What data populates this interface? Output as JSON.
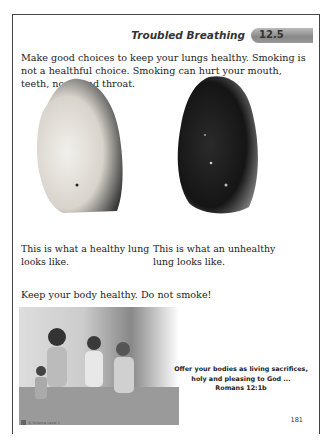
{
  "header": {
    "title": "Troubled Breathing",
    "lesson_number": "12.5"
  },
  "intro_text": "Make good choices to keep your lungs healthy. Smoking is not a healthful choice. Smoking can hurt your mouth, teeth, nose, and throat.",
  "images": {
    "healthy_lung": {
      "alt": "healthy lung"
    },
    "unhealthy_lung": {
      "alt": "unhealthy lung"
    },
    "family_photo": {
      "alt": "family running outdoors"
    }
  },
  "captions": {
    "healthy": "This is what a healthy lung looks like.",
    "unhealthy": "This is what an unhealthy lung looks like."
  },
  "closing_text": "Keep your body healthy. Do not smoke!",
  "verse": {
    "line1": "Offer your bodies as living sacrifices,",
    "line2": "holy and pleasing to God ...",
    "reference": "Romans 12:1b"
  },
  "footer": {
    "copyright": "© Science Level 1",
    "page_number": "181"
  },
  "colors": {
    "badge": "#999999",
    "border": "#444444",
    "text": "#222222"
  }
}
